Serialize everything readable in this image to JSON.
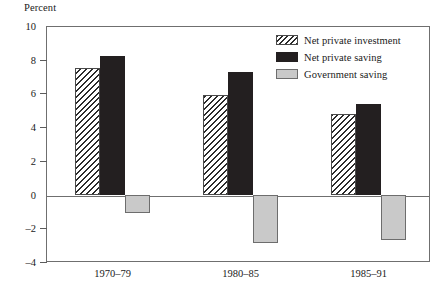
{
  "chart_data": {
    "type": "bar",
    "title": "",
    "ylabel": "Percent",
    "xlabel": "",
    "categories": [
      "1970–79",
      "1980–85",
      "1985–91"
    ],
    "series": [
      {
        "name": "Net private investment",
        "values": [
          7.5,
          5.9,
          4.8
        ],
        "style": "hatch",
        "color": "#ffffff"
      },
      {
        "name": "Net private saving",
        "values": [
          8.2,
          7.3,
          5.4
        ],
        "style": "solid",
        "color": "#231f20"
      },
      {
        "name": "Government saving",
        "values": [
          -1.1,
          -2.9,
          -2.7
        ],
        "style": "gray",
        "color": "#c9c9c9"
      }
    ],
    "ylim": [
      -4,
      10
    ],
    "yticks": [
      10,
      8,
      6,
      4,
      2,
      0,
      -2,
      -4
    ],
    "ytick_labels": [
      "10",
      "8",
      "6",
      "4",
      "2",
      "0",
      "–2",
      "–4"
    ],
    "grid": false,
    "legend_position": "top-right",
    "zero_line": 0
  },
  "axis": {
    "ylabel": "Percent"
  },
  "legend": {
    "entries": [
      {
        "label": "Net private investment"
      },
      {
        "label": "Net private saving"
      },
      {
        "label": "Government saving"
      }
    ]
  }
}
